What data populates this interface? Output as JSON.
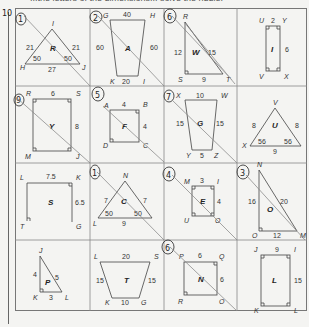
{
  "header": {
    "instruction_fragment": "...the letters of the dimensions... solve the riddle."
  },
  "margin_marks": {
    "page_number_handwritten": "10"
  },
  "cells": [
    {
      "id": "cell-1",
      "row": 0,
      "col": 0,
      "shape": "triangle",
      "letter": "R",
      "vertices": [
        "I",
        "H",
        "J"
      ],
      "sides": [
        "21",
        "21",
        "27"
      ],
      "angles": [
        "50",
        "50"
      ],
      "handwritten_number": "1",
      "crossed": true
    },
    {
      "id": "cell-2",
      "row": 0,
      "col": 1,
      "shape": "trapezoid",
      "letter": "A",
      "vertices": [
        "G",
        "H",
        "K",
        "I"
      ],
      "sides": [
        "40",
        "60",
        "60",
        "20"
      ],
      "handwritten_number": "2",
      "crossed": true
    },
    {
      "id": "cell-3",
      "row": 0,
      "col": 2,
      "shape": "right-triangle",
      "letter": "W",
      "vertices": [
        "R",
        "S",
        "T"
      ],
      "sides": [
        "12",
        "15",
        "9"
      ],
      "handwritten_number": "6",
      "crossed": true
    },
    {
      "id": "cell-4",
      "row": 0,
      "col": 3,
      "shape": "rectangle",
      "letter": "I",
      "vertices": [
        "U",
        "Y",
        "V",
        "X"
      ],
      "sides": [
        "2",
        "6"
      ],
      "handwritten_number": "",
      "crossed": false
    },
    {
      "id": "cell-5",
      "row": 1,
      "col": 0,
      "shape": "rectangle",
      "letter": "Y",
      "vertices": [
        "R",
        "S",
        "M",
        "J"
      ],
      "sides": [
        "6",
        "8"
      ],
      "handwritten_number": "9",
      "crossed": true
    },
    {
      "id": "cell-6",
      "row": 1,
      "col": 1,
      "shape": "square",
      "letter": "F",
      "vertices": [
        "A",
        "B",
        "D",
        "C"
      ],
      "sides": [
        "4",
        "4"
      ],
      "handwritten_number": "5",
      "crossed": true
    },
    {
      "id": "cell-7",
      "row": 1,
      "col": 2,
      "shape": "trapezoid",
      "letter": "G",
      "vertices": [
        "X",
        "W",
        "Y",
        "Z"
      ],
      "sides": [
        "10",
        "15",
        "15",
        "5"
      ],
      "handwritten_number": "7",
      "crossed": true
    },
    {
      "id": "cell-8",
      "row": 1,
      "col": 3,
      "shape": "triangle",
      "letter": "U",
      "vertices": [
        "V",
        "X",
        "W"
      ],
      "sides": [
        "8",
        "8",
        "9"
      ],
      "angles": [
        "56",
        "56"
      ],
      "handwritten_number": "",
      "crossed": false
    },
    {
      "id": "cell-9",
      "row": 2,
      "col": 0,
      "shape": "open-rectangle",
      "letter": "S",
      "vertices": [
        "L",
        "K",
        "T",
        "G"
      ],
      "sides": [
        "7.5",
        "6.5"
      ],
      "handwritten_number": "",
      "crossed": false
    },
    {
      "id": "cell-10",
      "row": 2,
      "col": 1,
      "shape": "triangle",
      "letter": "C",
      "vertices": [
        "N",
        "L",
        "M"
      ],
      "sides": [
        "7",
        "7",
        "9"
      ],
      "angles": [
        "50",
        "50"
      ],
      "handwritten_number": "1",
      "crossed": true
    },
    {
      "id": "cell-11",
      "row": 2,
      "col": 2,
      "shape": "rectangle",
      "letter": "E",
      "vertices": [
        "M",
        "I",
        "U",
        "O"
      ],
      "sides": [
        "3",
        "4"
      ],
      "handwritten_number": "4",
      "crossed": true
    },
    {
      "id": "cell-12",
      "row": 2,
      "col": 3,
      "shape": "right-triangle",
      "letter": "O",
      "vertices": [
        "N",
        "O",
        "M"
      ],
      "sides": [
        "16",
        "20",
        "12"
      ],
      "handwritten_number": "3",
      "crossed": true
    },
    {
      "id": "cell-13",
      "row": 3,
      "col": 0,
      "shape": "right-triangle",
      "letter": "P",
      "vertices": [
        "J",
        "K",
        "L"
      ],
      "sides": [
        "4",
        "5",
        "3"
      ],
      "handwritten_number": "",
      "crossed": false
    },
    {
      "id": "cell-14",
      "row": 3,
      "col": 1,
      "shape": "trapezoid",
      "letter": "T",
      "vertices": [
        "L",
        "S",
        "K",
        "G"
      ],
      "sides": [
        "20",
        "15",
        "15",
        "10"
      ],
      "handwritten_number": "",
      "crossed": false
    },
    {
      "id": "cell-15",
      "row": 3,
      "col": 2,
      "shape": "square",
      "letter": "N",
      "vertices": [
        "P",
        "Q",
        "R",
        "O"
      ],
      "sides": [
        "6",
        "6"
      ],
      "handwritten_number": "6",
      "crossed": true
    },
    {
      "id": "cell-16",
      "row": 3,
      "col": 3,
      "shape": "rectangle",
      "letter": "L",
      "vertices": [
        "J",
        "I",
        "K",
        "L"
      ],
      "sides": [
        "9",
        "15"
      ],
      "handwritten_number": "",
      "crossed": false
    }
  ]
}
